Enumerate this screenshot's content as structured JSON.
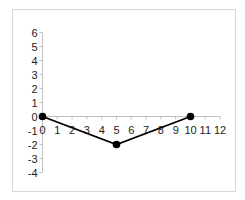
{
  "chart_data": {
    "type": "line",
    "title": "",
    "xlabel": "",
    "ylabel": "",
    "x": [
      0,
      5,
      10
    ],
    "series": [
      {
        "name": "Series 1",
        "values": [
          0,
          -2,
          0
        ],
        "color": "#000000",
        "marker": "circle"
      }
    ],
    "xlim": [
      0,
      12
    ],
    "ylim": [
      -4,
      6
    ],
    "x_ticks": [
      0,
      1,
      2,
      3,
      4,
      5,
      6,
      7,
      8,
      9,
      10,
      11,
      12
    ],
    "y_ticks": [
      6,
      5,
      4,
      3,
      2,
      1,
      0,
      -1,
      -2,
      -3,
      -4
    ],
    "grid": false,
    "legend": "none",
    "axis_color": "#c0c0c0"
  }
}
